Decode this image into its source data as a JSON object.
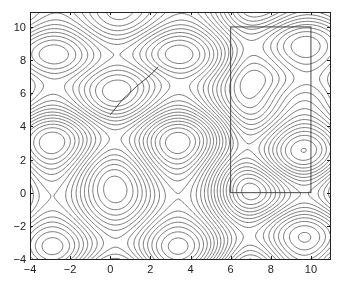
{
  "chart_data": {
    "type": "contour",
    "title": "",
    "xlabel": "",
    "ylabel": "",
    "xlim": [
      -4,
      11
    ],
    "ylim": [
      -4,
      11
    ],
    "x_ticks": [
      -4,
      -2,
      0,
      2,
      4,
      6,
      8,
      10
    ],
    "y_ticks": [
      -4,
      -2,
      0,
      2,
      4,
      6,
      8,
      10
    ],
    "x_tick_labels": [
      "−4",
      "−2",
      "0",
      "2",
      "4",
      "6",
      "8",
      "10"
    ],
    "y_tick_labels": [
      "−4",
      "−2",
      "0",
      "2",
      "4",
      "6",
      "8",
      "10"
    ],
    "grid": false,
    "legend": null,
    "line_color": "#555555",
    "extrema_centers": [
      [
        0,
        4.7
      ],
      [
        4.7,
        4.7
      ],
      [
        -3.1,
        2.8
      ],
      [
        2.8,
        2.8
      ],
      [
        0,
        0
      ],
      [
        4.7,
        0
      ],
      [
        -3.1,
        -3
      ],
      [
        2.8,
        -3
      ]
    ],
    "overlays": {
      "rectangle": {
        "x0": 6,
        "y0": 0,
        "x1": 10,
        "y1": 10
      },
      "curve": {
        "points": [
          [
            0,
            4.7
          ],
          [
            0.6,
            5.6
          ],
          [
            1.3,
            6.4
          ],
          [
            2.0,
            7.1
          ],
          [
            2.4,
            7.6
          ]
        ]
      }
    }
  }
}
